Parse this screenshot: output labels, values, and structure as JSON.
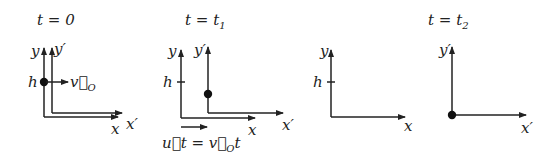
{
  "diagram": {
    "colors": {
      "ink": "#222222",
      "background": "#ffffff"
    },
    "panels": [
      {
        "title": "t = 0",
        "axes": {
          "y": "y",
          "y_prime": "y′",
          "x": "x",
          "x_prime": "x′"
        },
        "height_label": "h",
        "velocity_label": "v⃗",
        "velocity_sub": "O"
      },
      {
        "title_main": "t = t",
        "title_sub": "1",
        "axes": {
          "y": "y",
          "y_prime": "y′",
          "x": "x",
          "x_prime": "x′"
        },
        "height_label": "h",
        "displacement_label_left": "u⃗t = v⃗",
        "displacement_sub": "O",
        "displacement_right": "t"
      },
      {
        "axes": {
          "y": "y",
          "x": "x"
        },
        "height_label": "h"
      },
      {
        "title_main": "t = t",
        "title_sub": "2",
        "axes": {
          "y_prime": "y′",
          "x_prime": "x′"
        }
      }
    ]
  }
}
